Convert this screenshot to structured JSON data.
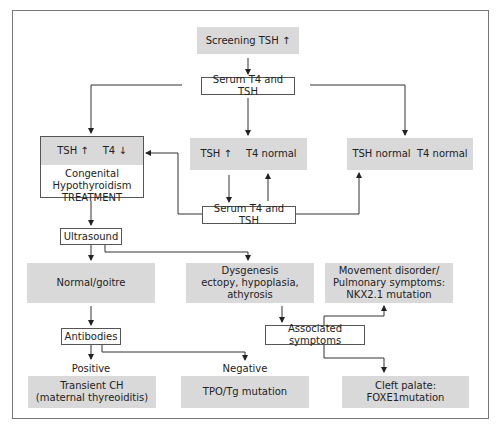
{
  "diagram": {
    "type": "flowchart",
    "nodes": {
      "screening": "Screening TSH ↑",
      "serum_top": "Serum T4 and TSH",
      "tsh_up_t4_down": {
        "tsh": "TSH ↑",
        "t4": "T4 ↓",
        "line1": "Congenital",
        "line2": "Hypothyroidism",
        "line3": "TREATMENT"
      },
      "tsh_up_t4_normal": {
        "tsh": "TSH ↑",
        "t4": "T4 normal"
      },
      "tsh_normal_t4_normal": "TSH normal  T4 normal",
      "serum_mid": "Serum T4 and TSH",
      "ultrasound": "Ultrasound",
      "normal_goitre": "Normal/goitre",
      "dysgenesis": {
        "line1": "Dysgenesis",
        "line2": "ectopy, hypoplasia, athyrosis"
      },
      "movement": {
        "line1": "Movement disorder/",
        "line2": "Pulmonary symptoms:",
        "line3": "NKX2.1 mutation"
      },
      "antibodies": "Antibodies",
      "associated": "Associated symptoms",
      "transient": {
        "line1": "Transient CH",
        "line2": "(maternal thyreoiditis)"
      },
      "tpo": "TPO/Tg mutation",
      "cleft": "Cleft palate: FOXE1mutation"
    },
    "edge_labels": {
      "positive": "Positive",
      "negative": "Negative"
    },
    "colors": {
      "box_fill": "#d9d9d9",
      "line": "#333333",
      "frame": "#777777"
    }
  }
}
